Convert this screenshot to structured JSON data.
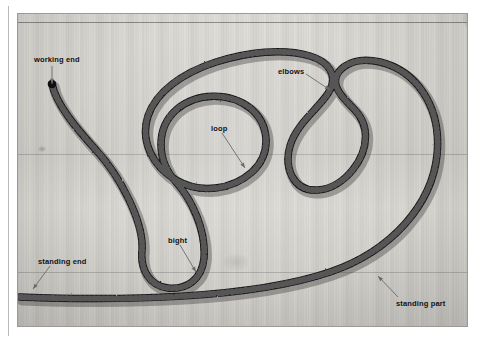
{
  "figure": {
    "kind": "photograph",
    "background_color": "#d9d7d2",
    "rope_color": "#141414",
    "label_color": "#111111",
    "arrow_color": "#6b6b6b"
  },
  "annotations": [
    {
      "id": "working-end",
      "label": "working end",
      "label_x": 34,
      "label_y": 55,
      "arrow": {
        "x1": 52,
        "y1": 66,
        "x2": 52,
        "y2": 84
      }
    },
    {
      "id": "elbows",
      "label": "elbows",
      "label_x": 278,
      "label_y": 67,
      "arrow": {
        "x1": 306,
        "y1": 74,
        "x2": 330,
        "y2": 90
      }
    },
    {
      "id": "loop",
      "label": "loop",
      "label_x": 211,
      "label_y": 124,
      "arrow": {
        "x1": 222,
        "y1": 133,
        "x2": 245,
        "y2": 168
      }
    },
    {
      "id": "bight",
      "label": "bight",
      "label_x": 168,
      "label_y": 236,
      "arrow": {
        "x1": 180,
        "y1": 245,
        "x2": 196,
        "y2": 272
      }
    },
    {
      "id": "standing-end",
      "label": "standing end",
      "label_x": 38,
      "label_y": 257,
      "arrow": {
        "x1": 50,
        "y1": 266,
        "x2": 33,
        "y2": 289
      }
    },
    {
      "id": "standing-part",
      "label": "standing part",
      "label_x": 396,
      "label_y": 299,
      "arrow": {
        "x1": 398,
        "y1": 297,
        "x2": 378,
        "y2": 276
      }
    }
  ],
  "rope_paths": {
    "main": "M 20 297 C 120 301, 250 299, 330 272 C 392 251, 432 204, 437 155 C 442 104, 414 70, 380 62 C 350 55, 330 72, 337 88 C 344 104, 362 110, 365 130 C 369 158, 344 188, 318 190 C 292 192, 284 166, 290 146 C 297 122, 322 106, 330 90 C 337 76, 330 62, 310 56 C 283 48, 248 52, 216 62 C 182 73, 156 92, 148 116 C 140 140, 152 166, 176 180 C 200 194, 232 190, 252 172 C 272 154, 270 124, 250 108 C 230 92, 196 92, 176 110 C 156 128, 156 160, 176 182 C 192 200, 206 230, 204 258 C 202 280, 186 290, 168 288 C 150 286, 140 270, 142 250 C 144 222, 120 176, 96 150 C 76 128, 56 104, 52 84",
    "stroke_width": 7.5
  }
}
